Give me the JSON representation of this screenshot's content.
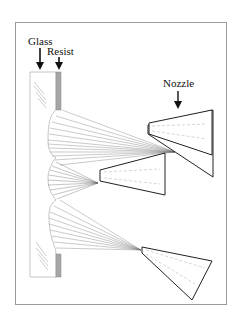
{
  "figure": {
    "labels": {
      "glass": "Glass",
      "resist": "Resist",
      "nozzle": "Nozzle"
    },
    "colors": {
      "frame": "#9a9a9a",
      "glass_outline": "#b8b8b8",
      "resist_fill": "#a6a6a6",
      "nozzle_stroke": "#222222",
      "spray": "#555555",
      "dashes": "#bbbbbb"
    },
    "nozzles": [
      {
        "name": "top-nozzle"
      },
      {
        "name": "middle-nozzle"
      },
      {
        "name": "bottom-nozzle"
      }
    ]
  }
}
